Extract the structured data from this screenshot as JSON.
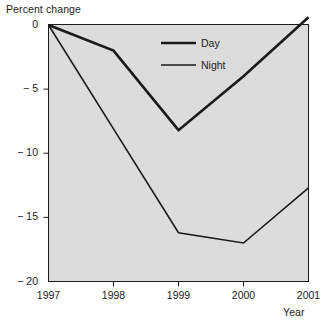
{
  "chart_data": {
    "type": "line",
    "title": "",
    "ylabel": "Percent change",
    "xlabel": "Year",
    "x": [
      1997,
      1998,
      1999,
      2000,
      2001
    ],
    "xtick_labels": [
      "1997",
      "1998",
      "1999",
      "2000",
      "2001"
    ],
    "ytick_labels": [
      "0",
      "− 5",
      "− 10",
      "− 15",
      "− 20"
    ],
    "ytick_values": [
      0,
      -5,
      -10,
      -15,
      -20
    ],
    "ylim": [
      -20,
      1
    ],
    "xlim": [
      1997,
      2001
    ],
    "grid": false,
    "legend_position": "upper-right-inside",
    "series": [
      {
        "name": "Day",
        "values": [
          0,
          -2.0,
          -8.2,
          -4.0,
          0.6
        ],
        "color": "#1a1a1a",
        "linewidth": 2.6
      },
      {
        "name": "Night",
        "values": [
          0,
          -8.1,
          -16.2,
          -17.0,
          -12.7
        ],
        "color": "#1a1a1a",
        "linewidth": 1.6
      }
    ],
    "plot_background": "#dcdcdc",
    "axis_color": "#1a1a1a",
    "page_background": "#ffffff"
  },
  "legend": {
    "items": [
      {
        "label": "Day"
      },
      {
        "label": "Night"
      }
    ]
  }
}
